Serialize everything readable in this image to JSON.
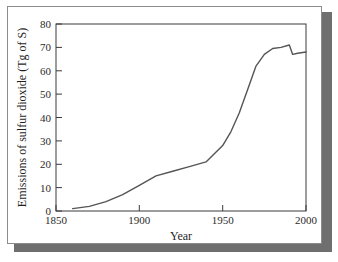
{
  "chart_data": {
    "type": "line",
    "title": "",
    "xlabel": "Year",
    "ylabel": "Emissions of sulfur dioxide (Tg of S)",
    "xlim": [
      1850,
      2000
    ],
    "ylim": [
      0,
      80
    ],
    "xticks": [
      1850,
      1900,
      1950,
      2000
    ],
    "xtick_labels": [
      "1850",
      "1900",
      "1950",
      "2000"
    ],
    "yticks": [
      0,
      10,
      20,
      30,
      40,
      50,
      60,
      70,
      80
    ],
    "ytick_labels": [
      "0",
      "10",
      "20",
      "30",
      "40",
      "50",
      "60",
      "70",
      "80"
    ],
    "grid": false,
    "legend": false,
    "series": [
      {
        "name": "Global sulfur dioxide emissions",
        "color": "#555555",
        "x": [
          1860,
          1870,
          1880,
          1890,
          1900,
          1910,
          1920,
          1930,
          1940,
          1950,
          1955,
          1960,
          1965,
          1970,
          1975,
          1980,
          1985,
          1990,
          1992,
          1995,
          2000
        ],
        "values": [
          1,
          2,
          4,
          7,
          11,
          15,
          17,
          19,
          21,
          28,
          34,
          42,
          52,
          62,
          67,
          69.5,
          70,
          71,
          67,
          67.5,
          68
        ]
      }
    ]
  },
  "axes": {
    "x_axis_label": "Year",
    "y_axis_label": "Emissions of sulfur dioxide (Tg of S)"
  },
  "colors": {
    "line": "#555555",
    "axis": "#3a3a3a",
    "card_border": "#8c8c8c",
    "shadow": "#6f6f6f",
    "background": "#ffffff",
    "text": "#1f1f1f"
  }
}
